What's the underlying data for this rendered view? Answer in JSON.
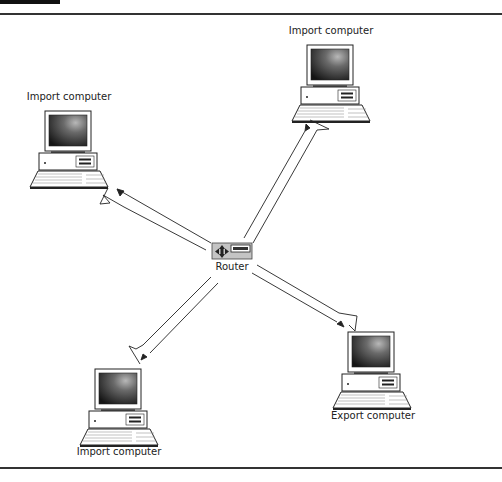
{
  "diagram": {
    "type": "network",
    "nodes": [
      {
        "id": "router",
        "label": "Router",
        "kind": "router"
      },
      {
        "id": "import-left",
        "label": "Import computer",
        "kind": "computer"
      },
      {
        "id": "import-top-right",
        "label": "Import computer",
        "kind": "computer"
      },
      {
        "id": "import-bottom-left",
        "label": "Import computer",
        "kind": "computer"
      },
      {
        "id": "export-bottom-right",
        "label": "Export computer",
        "kind": "computer"
      }
    ],
    "edges": [
      {
        "from": "router",
        "to": "import-left",
        "style": "lightning-arrow"
      },
      {
        "from": "router",
        "to": "import-top-right",
        "style": "lightning-arrow"
      },
      {
        "from": "router",
        "to": "import-bottom-left",
        "style": "lightning-arrow"
      },
      {
        "from": "router",
        "to": "export-bottom-right",
        "style": "lightning-arrow"
      }
    ]
  },
  "labels": {
    "router": "Router",
    "left": "Import computer",
    "top_right": "Import computer",
    "bottom_left": "Import computer",
    "bottom_right": "Export computer"
  },
  "colors": {
    "line": "#222222",
    "screen_dark": "#1a1a1a",
    "screen_light": "#9a9a9a",
    "router_bg": "#bdbdbd"
  }
}
